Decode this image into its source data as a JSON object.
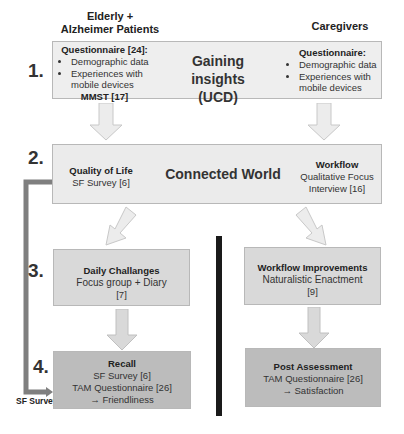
{
  "columns": {
    "left_header": "Elderly + Alzheimer Patients",
    "right_header": "Caregivers"
  },
  "steps": [
    {
      "number": "1.",
      "center_title": "Gaining insights",
      "center_subtitle": "(UCD)",
      "left": {
        "title": "Questionnaire [24]:",
        "bullets": [
          "Demographic data",
          "Experiences with mobile devices"
        ],
        "footer": "MMST [17]"
      },
      "right": {
        "title": "Questionnaire:",
        "bullets": [
          "Demographic data",
          "Experiences with mobile devices"
        ]
      }
    },
    {
      "number": "2.",
      "center_title": "Connected World",
      "left": {
        "title": "Quality of Life",
        "line1": "SF Survey [6]"
      },
      "right": {
        "title": "Workflow",
        "line1": "Qualitative Focus",
        "line2": "Interview [16]"
      }
    },
    {
      "number": "3.",
      "left": {
        "title": "Daily Challanges",
        "line1": "Focus group + Diary",
        "line2": "[7]"
      },
      "right": {
        "title": "Workflow Improvements",
        "line1": "Naturalistic Enactment",
        "line2": "[9]"
      }
    },
    {
      "number": "4.",
      "left": {
        "title": "Recall",
        "line1": "SF Survey [6]",
        "line2": "TAM Questionnaire [26]",
        "line3": "→ Friendliness"
      },
      "right": {
        "title": "Post Assessment",
        "line1": "TAM Questionnaire [26]",
        "line2": "→ Satisfaction"
      }
    }
  ],
  "feedback_connector": {
    "label": "SF Survey",
    "color": "#7f7f7f"
  },
  "divider": {
    "color": "#1a1a1a"
  },
  "colors": {
    "row1_fill": "#eeeeee",
    "row2_fill": "#ebebeb",
    "row3_fill": "#d9d9d9",
    "row4_fill": "#bcbcbc",
    "arrow_fill": "#ebebeb",
    "arrow_stroke": "#c8c8c8"
  }
}
